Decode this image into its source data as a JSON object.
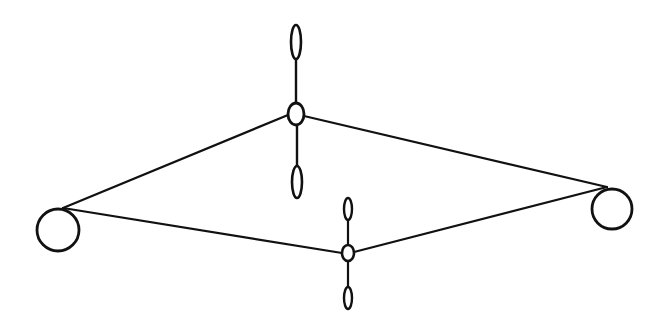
{
  "diagram": {
    "colors": {
      "stroke": "#111111",
      "background": "#ffffff"
    },
    "end_circles": [
      {
        "id": "left",
        "cx": 58,
        "cy": 230,
        "r": 21
      },
      {
        "id": "right",
        "cx": 612,
        "cy": 209,
        "r": 20
      }
    ],
    "rotors": [
      {
        "id": "upper",
        "hub": {
          "cx": 296,
          "cy": 114,
          "rx": 8,
          "ry": 11
        },
        "blade_top": {
          "cx": 296,
          "cy": 42,
          "rx": 5,
          "ry": 17
        },
        "blade_bottom": {
          "cx": 297,
          "cy": 182,
          "rx": 5,
          "ry": 16
        }
      },
      {
        "id": "lower",
        "hub": {
          "cx": 348,
          "cy": 253,
          "rx": 6,
          "ry": 8
        },
        "blade_top": {
          "cx": 348,
          "cy": 209,
          "rx": 4,
          "ry": 11
        },
        "blade_bottom": {
          "cx": 348,
          "cy": 298,
          "rx": 4,
          "ry": 11
        }
      }
    ],
    "connecting_lines": [
      {
        "from": "left-circle",
        "to": "upper-hub",
        "x1": 63,
        "y1": 208,
        "x2": 288,
        "y2": 115
      },
      {
        "from": "upper-hub",
        "to": "right-circle",
        "x1": 304,
        "y1": 116,
        "x2": 607,
        "y2": 187
      },
      {
        "from": "left-circle",
        "to": "lower-hub",
        "x1": 63,
        "y1": 208,
        "x2": 342,
        "y2": 253
      },
      {
        "from": "lower-hub",
        "to": "right-circle",
        "x1": 354,
        "y1": 252,
        "x2": 607,
        "y2": 187
      }
    ]
  }
}
